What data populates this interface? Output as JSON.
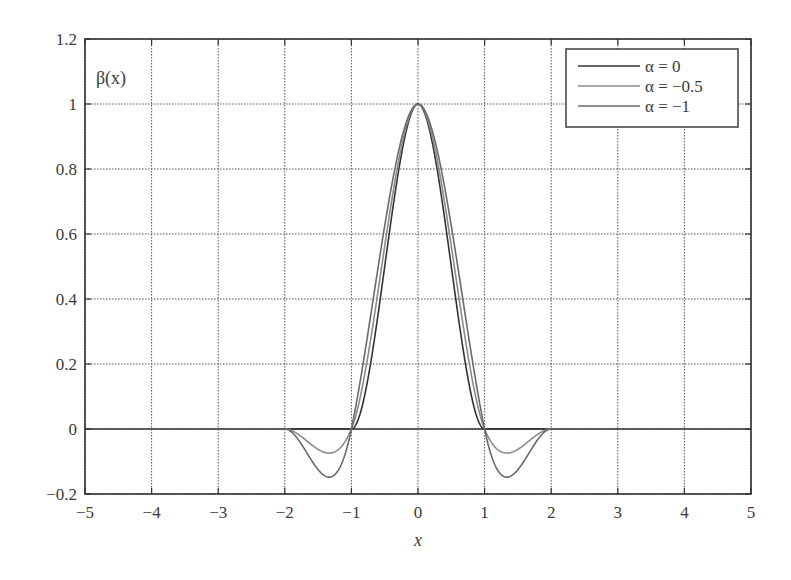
{
  "chart_data": {
    "type": "line",
    "title": "",
    "xlabel": "x",
    "ylabel": "β(x)",
    "xlim": [
      -5,
      5
    ],
    "ylim": [
      -0.2,
      1.2
    ],
    "xticks": [
      -5,
      -4,
      -3,
      -2,
      -1,
      0,
      1,
      2,
      3,
      4,
      5
    ],
    "xtick_labels": [
      "−5",
      "−4",
      "−3",
      "−2",
      "−1",
      "0",
      "1",
      "2",
      "3",
      "4",
      "5"
    ],
    "yticks": [
      -0.2,
      0,
      0.2,
      0.4,
      0.6,
      0.8,
      1,
      1.2
    ],
    "ytick_labels": [
      "−0.2",
      "0",
      "0.2",
      "0.4",
      "0.6",
      "0.8",
      "1",
      "1.2"
    ],
    "grid": true,
    "legend_position": "upper right",
    "x": [
      -2.0,
      -1.8,
      -1.6,
      -1.5,
      -1.4,
      -1.33,
      -1.2,
      -1.1,
      -1.0,
      -0.8,
      -0.6,
      -0.4,
      -0.2,
      0.0,
      0.2,
      0.4,
      0.6,
      0.8,
      1.0,
      1.1,
      1.2,
      1.33,
      1.4,
      1.5,
      1.6,
      1.8,
      2.0
    ],
    "series": [
      {
        "name": "α = 0",
        "color": "#333333",
        "values": [
          0,
          0,
          0,
          0,
          0,
          0,
          0,
          0,
          0,
          0.104,
          0.352,
          0.648,
          0.896,
          1.0,
          0.896,
          0.648,
          0.352,
          0.104,
          0,
          0,
          0,
          0,
          0,
          0,
          0,
          0,
          0
        ]
      },
      {
        "name": "α = −0.5",
        "color": "#8a8a8a",
        "values": [
          0,
          -0.016,
          -0.048,
          -0.0625,
          -0.072,
          -0.074,
          -0.064,
          -0.0405,
          0,
          0.056,
          0.352,
          0.664,
          0.912,
          1.0,
          0.912,
          0.664,
          0.352,
          0.056,
          0,
          -0.0405,
          -0.064,
          -0.074,
          -0.072,
          -0.0625,
          -0.048,
          -0.016,
          0
        ]
      },
      {
        "name": "α = −1",
        "color": "#6a6a6a",
        "values": [
          0,
          -0.032,
          -0.096,
          -0.125,
          -0.144,
          -0.148,
          -0.128,
          -0.081,
          0,
          0.008,
          0.352,
          0.68,
          0.928,
          1.0,
          0.928,
          0.68,
          0.352,
          0.008,
          0,
          -0.081,
          -0.128,
          -0.148,
          -0.144,
          -0.125,
          -0.096,
          -0.032,
          0
        ]
      }
    ],
    "legend": [
      "α = 0",
      "α = −0.5",
      "α = −1"
    ]
  }
}
